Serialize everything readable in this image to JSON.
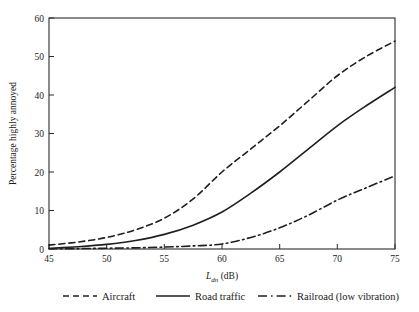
{
  "chart_data": {
    "type": "line",
    "title": "",
    "subtitle": "",
    "xlabel": "Ldn (dB)",
    "xlabel_parts": {
      "variable": "L",
      "subscript": "dn",
      "unit": "(dB)"
    },
    "ylabel": "Percentage highly annoyed",
    "xlim": [
      45,
      75
    ],
    "ylim": [
      0,
      60
    ],
    "xticks": [
      45,
      50,
      55,
      60,
      65,
      70,
      75
    ],
    "yticks": [
      0,
      10,
      20,
      30,
      40,
      50,
      60
    ],
    "xtick_labels": [
      "45",
      "50",
      "55",
      "60",
      "65",
      "70",
      "75"
    ],
    "ytick_labels": [
      "0",
      "10",
      "20",
      "30",
      "40",
      "50",
      "60"
    ],
    "grid": false,
    "legend_position": "bottom",
    "x": [
      45,
      47.5,
      50,
      52.5,
      55,
      57.5,
      60,
      62.5,
      65,
      67.5,
      70,
      72.5,
      75
    ],
    "series": [
      {
        "name": "Aircraft",
        "style": "dashed",
        "color": "#1f1f1f",
        "values": [
          1.0,
          1.8,
          3.0,
          5.0,
          8.0,
          13.0,
          20.0,
          26.0,
          32.0,
          38.5,
          45.0,
          50.0,
          54.0
        ]
      },
      {
        "name": "Road traffic",
        "style": "solid",
        "color": "#1f1f1f",
        "values": [
          0.2,
          0.6,
          1.2,
          2.2,
          3.8,
          6.2,
          9.6,
          14.5,
          20.0,
          26.0,
          32.0,
          37.2,
          42.0
        ]
      },
      {
        "name": "Railroad (low vibration)",
        "style": "dashdot",
        "color": "#1f1f1f",
        "values": [
          0.05,
          0.1,
          0.2,
          0.3,
          0.5,
          0.8,
          1.3,
          3.0,
          5.5,
          8.8,
          12.7,
          15.9,
          19.0
        ]
      }
    ]
  },
  "legend": {
    "items": [
      {
        "label": "Aircraft",
        "style": "dashed"
      },
      {
        "label": "Road traffic",
        "style": "solid"
      },
      {
        "label": "Railroad (low vibration)",
        "style": "dashdot"
      }
    ]
  }
}
